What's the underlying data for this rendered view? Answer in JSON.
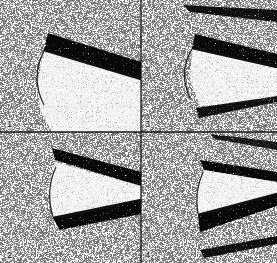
{
  "figure": {
    "layout": "2x2 grid of stippled diagram panels",
    "width": 277,
    "height": 263,
    "divider": {
      "x": 141,
      "y": 132,
      "color": "#1a1a1a"
    },
    "colors": {
      "background_stipple": "#9a9a9a",
      "dark_band": "#2a2a2a",
      "edge_line": "#111111",
      "light_wedge": "#f4f4f4"
    },
    "panels": [
      {
        "id": "panel-1",
        "label": "1",
        "position": "top-left",
        "description": "Light wedge bounded by a curved arc on the left, a thick dark edge line along its upper side, and one dark stippled band above it"
      },
      {
        "id": "panel-3",
        "label": "3",
        "position": "top-right",
        "description": "Light wedge with curved left arc, dark edge line on upper side, a stippled band above, plus a second dark stippled band at the top and another below"
      },
      {
        "id": "panel-2",
        "label": "2",
        "position": "bottom-left",
        "description": "Light wedge with curved left arc, dark stippled band along the upper edge and a thick dark line with stippled band along the lower edge"
      },
      {
        "id": "panel-4",
        "label": "4",
        "position": "bottom-right",
        "description": "Light wedge with curved left arc, stippled band along upper edge, thick dark line with stippled band along lower edge, plus extra stippled bands at top and bottom"
      }
    ]
  }
}
